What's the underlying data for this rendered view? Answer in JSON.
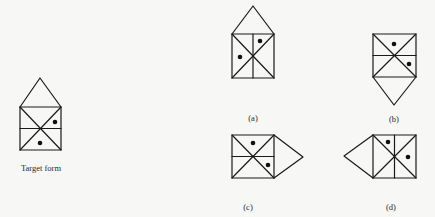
{
  "figure": {
    "target": {
      "label": "Target form",
      "label_pos": [
        41,
        163
      ],
      "roof": {
        "apex": [
          40,
          78
        ],
        "side": "top"
      },
      "box": {
        "x": 20,
        "y": 107,
        "w": 41,
        "h": 43
      },
      "divider": "horizontal",
      "dots": [
        [
          55,
          122
        ],
        [
          40,
          143
        ]
      ]
    },
    "options": [
      {
        "id": "a",
        "label": "(a)",
        "label_pos": [
          253,
          113
        ],
        "roof": {
          "apex": [
            253,
            6
          ],
          "side": "top"
        },
        "box": {
          "x": 232,
          "y": 34,
          "w": 42,
          "h": 44
        },
        "divider": "vertical",
        "dots": [
          [
            260,
            41
          ],
          [
            240,
            57
          ]
        ]
      },
      {
        "id": "b",
        "label": "(b)",
        "label_pos": [
          394,
          114
        ],
        "roof": {
          "apex": [
            394,
            105
          ],
          "side": "bottom"
        },
        "box": {
          "x": 373,
          "y": 34,
          "w": 43,
          "h": 43
        },
        "divider": "horizontal",
        "dots": [
          [
            394,
            44
          ],
          [
            409,
            64
          ]
        ]
      },
      {
        "id": "c",
        "label": "(c)",
        "label_pos": [
          248,
          202
        ],
        "roof": {
          "apex": [
            303,
            157
          ],
          "side": "right"
        },
        "box": {
          "x": 232,
          "y": 135,
          "w": 42,
          "h": 43
        },
        "divider": "horizontal",
        "dots": [
          [
            253,
            143
          ],
          [
            268,
            165
          ]
        ]
      },
      {
        "id": "d",
        "label": "(d)",
        "label_pos": [
          391,
          202
        ],
        "roof": {
          "apex": [
            344,
            156
          ],
          "side": "left"
        },
        "box": {
          "x": 373,
          "y": 135,
          "w": 43,
          "h": 43
        },
        "divider": "vertical",
        "dots": [
          [
            388,
            142
          ],
          [
            408,
            157
          ]
        ]
      }
    ]
  }
}
